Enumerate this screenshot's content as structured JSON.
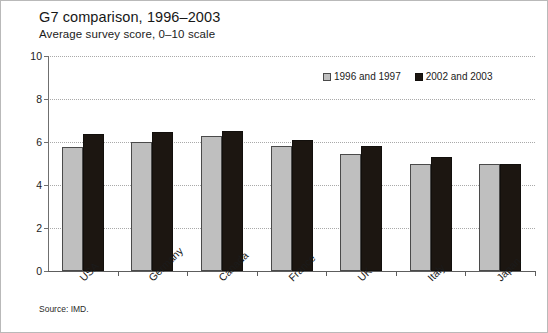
{
  "figure": {
    "title": "G7 comparison, 1996–2003",
    "subtitle": "Average survey score, 0–10 scale",
    "source": "Source: IMD."
  },
  "chart_data": {
    "type": "bar",
    "title": "G7 comparison, 1996–2003",
    "subtitle": "Average survey score, 0–10 scale",
    "xlabel": "",
    "ylabel": "",
    "ylim": [
      0,
      10
    ],
    "yticks": [
      0,
      2,
      4,
      6,
      8,
      10
    ],
    "ytick_labels": [
      "0",
      "2",
      "4",
      "6",
      "8",
      "10"
    ],
    "grid": "horizontal-dotted",
    "legend_position": "top-right-inside",
    "categories": [
      "USA",
      "Germany",
      "Canada",
      "France",
      "UK",
      "Italy",
      "Japan"
    ],
    "series": [
      {
        "name": "1996 and 1997",
        "color": "#bfbfbf",
        "values": [
          5.75,
          6.0,
          6.3,
          5.8,
          5.45,
          5.0,
          5.0
        ]
      },
      {
        "name": "2002 and 2003",
        "color": "#1c1611",
        "values": [
          6.35,
          6.45,
          6.5,
          6.1,
          5.8,
          5.3,
          5.0
        ]
      }
    ]
  }
}
